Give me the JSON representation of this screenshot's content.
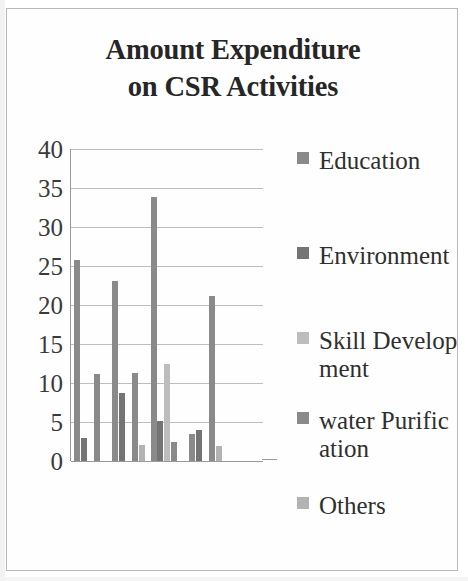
{
  "chart_data": {
    "type": "bar",
    "title": "Amount Expenditure on CSR Activities",
    "title_lines": [
      "Amount Expenditure",
      "on CSR Activities"
    ],
    "xlabel": "",
    "ylabel": "",
    "ylim": [
      0,
      40
    ],
    "yticks": [
      40,
      35,
      30,
      25,
      20,
      15,
      10,
      5,
      0
    ],
    "grid": true,
    "legend_position": "right",
    "categories": [
      "2016-17",
      "2017-18",
      "2018-19",
      "2019-20",
      "2020-21"
    ],
    "series": [
      {
        "name": "Education",
        "color": "#8a8a8a",
        "values": [
          25.8,
          23.1,
          33.8,
          3.4,
          0
        ]
      },
      {
        "name": "Environment",
        "color": "#747474",
        "values": [
          2.9,
          8.7,
          5.1,
          4.0,
          0
        ]
      },
      {
        "name": "Skill Development",
        "color": "#bdbdbd",
        "values": [
          0,
          0,
          12.4,
          0,
          0
        ]
      },
      {
        "name": "water Purification",
        "color": "#8a8a8a",
        "values": [
          11.1,
          11.3,
          2.4,
          21.2,
          0
        ]
      },
      {
        "name": "Others",
        "color": "#b3b3b3",
        "values": [
          0,
          2.0,
          0,
          1.9,
          0
        ]
      }
    ],
    "legend_entries": [
      {
        "label": "Education",
        "color": "#8a8a8a"
      },
      {
        "label": "Environment",
        "color": "#747474"
      },
      {
        "label": "Skill Development",
        "color": "#bdbdbd"
      },
      {
        "label": "water Purification",
        "color": "#8a8a8a"
      },
      {
        "label": "Others",
        "color": "#b3b3b3"
      }
    ]
  }
}
